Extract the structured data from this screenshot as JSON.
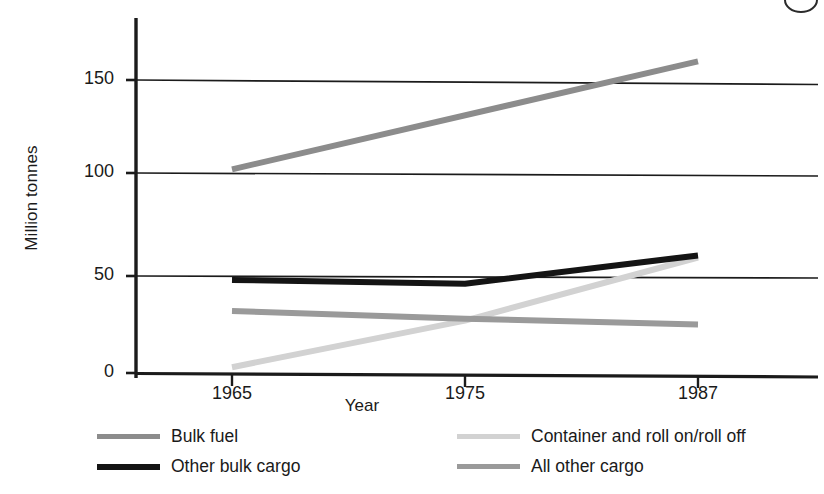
{
  "figure": {
    "page_badge": "page-number-circle"
  },
  "chart_data": {
    "type": "line",
    "title": "",
    "xlabel": "Year",
    "ylabel": "Million tonnes",
    "x": [
      1965,
      1975,
      1987
    ],
    "xticklabels": [
      "1965",
      "1975",
      "1987"
    ],
    "yticklabels": [
      "0",
      "50",
      "100",
      "150"
    ],
    "yticks": [
      0,
      50,
      100,
      150
    ],
    "ylim": [
      0,
      175
    ],
    "xlim": [
      1961,
      1992
    ],
    "grid": "horizontal",
    "legend_position": "below-axes-two-columns",
    "series": [
      {
        "name": "Bulk fuel",
        "values": [
          102,
          131,
          160
        ],
        "color": "#8c8c8c",
        "width": 6
      },
      {
        "name": "Other bulk cargo",
        "values": [
          48,
          46,
          60
        ],
        "color": "#141414",
        "width": 6
      },
      {
        "name": "Container and roll on/roll off",
        "values": [
          3,
          27,
          59
        ],
        "color": "#d2d2d2",
        "width": 6
      },
      {
        "name": "All other cargo",
        "values": [
          32,
          28,
          25
        ],
        "color": "#9a9a9a",
        "width": 6
      }
    ]
  },
  "axes": {
    "ylabel": "Million tonnes",
    "xlabel": "Year",
    "yticks": [
      {
        "label": "150"
      },
      {
        "label": "100"
      },
      {
        "label": "50"
      },
      {
        "label": "0"
      }
    ],
    "xticks": [
      {
        "label": "1965"
      },
      {
        "label": "1975"
      },
      {
        "label": "1987"
      }
    ]
  },
  "legend": {
    "entries": [
      {
        "label": "Bulk fuel",
        "color": "#8c8c8c"
      },
      {
        "label": "Other bulk cargo",
        "color": "#141414"
      },
      {
        "label": "Container and roll on/roll off",
        "color": "#d2d2d2"
      },
      {
        "label": "All other cargo",
        "color": "#9a9a9a"
      }
    ]
  }
}
